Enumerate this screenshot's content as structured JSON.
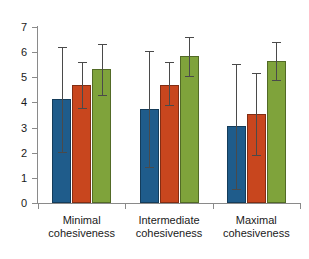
{
  "chart_data": {
    "type": "bar",
    "title": "",
    "subtitle": "",
    "xlabel": "",
    "ylabel": "",
    "ylim": [
      0,
      7
    ],
    "ytick_values": [
      0,
      1,
      2,
      3,
      4,
      5,
      6,
      7
    ],
    "ytick_labels": [
      "0",
      "1",
      "2",
      "3",
      "4",
      "5",
      "6",
      "7"
    ],
    "grid": false,
    "legend": "none",
    "categories": [
      "Minimal cohesiveness",
      "Intermediate cohesiveness",
      "Maximal cohesiveness"
    ],
    "category_lines": [
      [
        "Minimal",
        "cohesiveness"
      ],
      [
        "Intermediate",
        "cohesiveness"
      ],
      [
        "Maximal",
        "cohesiveness"
      ]
    ],
    "series": [
      {
        "name": "series-1",
        "color": "#1f5c8b",
        "values": [
          4.12,
          3.72,
          3.05
        ],
        "error_low": [
          2.02,
          1.42,
          0.55
        ],
        "error_high": [
          6.22,
          6.05,
          5.52
        ]
      },
      {
        "name": "series-2",
        "color": "#c8461e",
        "values": [
          4.68,
          4.7,
          3.55
        ],
        "error_low": [
          3.76,
          3.88,
          1.9
        ],
        "error_high": [
          5.6,
          5.6,
          5.18
        ]
      },
      {
        "name": "series-3",
        "color": "#7fa33b",
        "values": [
          5.35,
          5.85,
          5.66
        ],
        "error_low": [
          4.3,
          5.07,
          4.9
        ],
        "error_high": [
          6.32,
          6.6,
          6.4
        ]
      }
    ]
  }
}
